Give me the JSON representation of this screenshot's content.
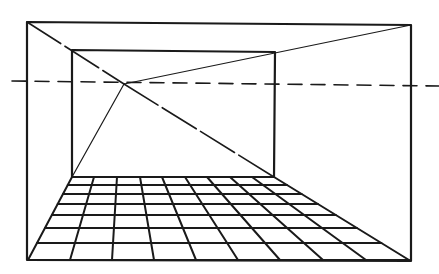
{
  "diagram": {
    "type": "one-point-perspective",
    "colors": {
      "ink": "#1a1a1a",
      "background": "#ffffff"
    },
    "vanishing_point": {
      "x": 124,
      "y": 84
    },
    "horizon_line": {
      "y1": 81,
      "y2": 86,
      "x_start": 12,
      "x_end": 439,
      "dash": "14 9"
    },
    "outer_frame": {
      "tl": [
        27,
        22
      ],
      "tr": [
        411,
        25
      ],
      "br": [
        411,
        261
      ],
      "bl": [
        27,
        260
      ]
    },
    "inner_frame": {
      "tl": [
        72,
        50
      ],
      "tr": [
        275,
        52
      ],
      "br": [
        274,
        177
      ],
      "bl": [
        72,
        177
      ]
    },
    "converging_lines": [
      {
        "name": "top-left-diagonal",
        "from": [
          27,
          22
        ],
        "to": [
          124,
          84
        ],
        "dashed": true
      },
      {
        "name": "top-right-line",
        "from": [
          411,
          25
        ],
        "to": [
          124,
          84
        ],
        "dashed": false
      },
      {
        "name": "bottom-left-line",
        "from": [
          72,
          177
        ],
        "to": [
          124,
          84
        ],
        "dashed": false
      },
      {
        "name": "bottom-right-diagonal",
        "from": [
          124,
          84
        ],
        "to": [
          274,
          177
        ],
        "dashed": true
      }
    ],
    "floor_grid": {
      "back_y": 177,
      "front_y": 260,
      "back_x": [
        72,
        94,
        117,
        140,
        162,
        185,
        207,
        230,
        252,
        274
      ],
      "front_x": [
        28,
        70,
        112,
        154,
        196,
        238,
        280,
        323,
        366,
        409
      ],
      "rows_y": [
        177,
        185,
        194,
        204,
        215,
        228,
        243,
        260
      ]
    }
  }
}
